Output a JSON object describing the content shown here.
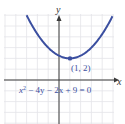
{
  "diagram": {
    "type": "parabola-graph",
    "equation": "x² − 4y − 2x + 9 = 0",
    "equation_parts": {
      "x": "x",
      "sup": "2",
      "rest": " − 4y − 2x + 9 = 0"
    },
    "axes": {
      "x_label": "x",
      "y_label": "y"
    },
    "vertex": {
      "x": 1,
      "y": 2,
      "label": "(1, 2)"
    },
    "colors": {
      "curve": "#3b4fa0",
      "grid": "#e4e4e8",
      "axis": "#3a3a3a"
    },
    "grid": {
      "cell_px": 10.8,
      "origin_px": [
        59,
        80
      ]
    }
  }
}
